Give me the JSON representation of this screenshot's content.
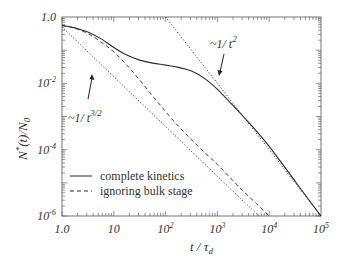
{
  "chart_data": {
    "type": "line",
    "title": "",
    "xlabel": "t / τ_d",
    "ylabel": "N*(t)/N_0",
    "xscale": "log",
    "yscale": "log",
    "xlim": [
      1.0,
      100000
    ],
    "ylim": [
      1e-06,
      1.0
    ],
    "grid": false,
    "legend_position": "lower left",
    "x_ticks": [
      {
        "value": 1,
        "label": "1.0"
      },
      {
        "value": 10,
        "label": "10"
      },
      {
        "value": 100,
        "label": "10",
        "sup": "2"
      },
      {
        "value": 1000,
        "label": "10",
        "sup": "3"
      },
      {
        "value": 10000,
        "label": "10",
        "sup": "4"
      },
      {
        "value": 100000,
        "label": "10",
        "sup": "5"
      }
    ],
    "y_ticks": [
      {
        "value": 1.0,
        "label": "1.0"
      },
      {
        "value": 0.01,
        "label": "10",
        "sup": "-2"
      },
      {
        "value": 0.0001,
        "label": "10",
        "sup": "-4"
      },
      {
        "value": 1e-06,
        "label": "10",
        "sup": "-6"
      }
    ],
    "series": [
      {
        "name": "complete kinetics",
        "style": "solid",
        "log10_t": [
          0,
          0.25,
          0.5,
          0.75,
          1.0,
          1.25,
          1.5,
          1.75,
          2.0,
          2.25,
          2.5,
          2.75,
          3.0,
          3.25,
          3.5,
          3.75,
          4.0,
          4.25,
          4.5,
          4.75,
          5.0
        ],
        "log10_N": [
          -0.25,
          -0.33,
          -0.45,
          -0.65,
          -0.92,
          -1.15,
          -1.3,
          -1.39,
          -1.45,
          -1.52,
          -1.63,
          -1.85,
          -2.18,
          -2.58,
          -3.0,
          -3.43,
          -3.9,
          -4.42,
          -4.95,
          -5.48,
          -6.0
        ]
      },
      {
        "name": "ignoring bulk stage",
        "style": "dashed",
        "log10_t": [
          0,
          0.25,
          0.5,
          0.75,
          1.0,
          1.25,
          1.5,
          1.75,
          2.0,
          2.25,
          2.5,
          2.75,
          3.0,
          3.25,
          3.5,
          3.75,
          4.0
        ],
        "log10_N": [
          -0.25,
          -0.34,
          -0.5,
          -0.75,
          -1.05,
          -1.45,
          -1.9,
          -2.38,
          -2.85,
          -3.3,
          -3.7,
          -4.08,
          -4.45,
          -4.85,
          -5.25,
          -5.62,
          -6.0
        ]
      },
      {
        "name": "~1/t^{3/2} asymptote",
        "style": "dotted",
        "log10_t": [
          0,
          3.8
        ],
        "log10_N": [
          -0.3,
          -6.0
        ]
      },
      {
        "name": "~1/t^2 asymptote",
        "style": "dotted",
        "log10_t": [
          2.0,
          5.0
        ],
        "log10_N": [
          0.0,
          -6.0
        ]
      }
    ],
    "annotations": [
      {
        "text": "~1/ t",
        "sup": "3/2",
        "arrow_to_series": "~1/t^{3/2} asymptote"
      },
      {
        "text": "~1/ t",
        "sup": "2",
        "arrow_to_series": "~1/t^2 asymptote"
      }
    ],
    "legend": [
      {
        "label": "complete kinetics",
        "style": "solid"
      },
      {
        "label": "ignoring bulk stage",
        "style": "dashed"
      }
    ]
  },
  "labels": {
    "x_axis_main": "t / τ",
    "x_axis_sub": "d",
    "y_axis_n": "N",
    "y_axis_star": "*",
    "y_axis_mid": "(t)/N",
    "y_axis_sub": "0",
    "annot_32_main": "~1/ t",
    "annot_32_sup": "3/2",
    "annot_2_main": "~1/ t",
    "annot_2_sup": "2",
    "legend_solid": "complete kinetics",
    "legend_dashed": "ignoring bulk stage"
  },
  "colors": {
    "line": "#2a2a2a",
    "axis": "#555555",
    "background": "#ffffff"
  }
}
